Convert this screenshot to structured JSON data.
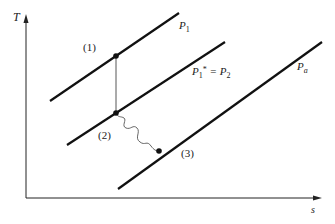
{
  "diagram": {
    "type": "T-s diagram",
    "axes": {
      "y_label": "T",
      "x_label": "s"
    },
    "isobars": [
      {
        "id": "p1",
        "label": "P",
        "sub": "1",
        "sup": ""
      },
      {
        "id": "p2",
        "label": "P",
        "sub": "1",
        "sup": "*",
        "eq": " = P",
        "eq_sub": "2"
      },
      {
        "id": "pa",
        "label": "P",
        "sub": "a",
        "sup": ""
      }
    ],
    "states": [
      {
        "id": "1",
        "label": "(1)"
      },
      {
        "id": "2",
        "label": "(2)"
      },
      {
        "id": "3",
        "label": "(3)"
      }
    ],
    "colors": {
      "line": "#111111",
      "thin_line": "#555555"
    }
  }
}
